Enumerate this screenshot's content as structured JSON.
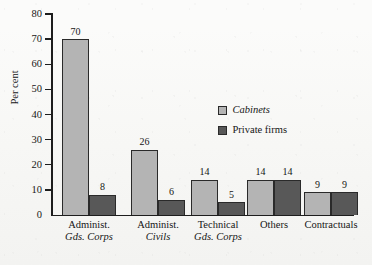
{
  "chart_data": {
    "type": "bar",
    "title": "",
    "xlabel": "",
    "ylabel": "Per cent",
    "ylim": [
      0,
      80
    ],
    "ytick_step": 10,
    "grid": false,
    "legend_position": "inside-right",
    "categories": [
      {
        "line1": "Administ.",
        "line2": "Gds. Corps"
      },
      {
        "line1": "Administ.",
        "line2": "Civils"
      },
      {
        "line1": "Technical",
        "line2": "Gds. Corps"
      },
      {
        "line1": "Others",
        "line2": ""
      },
      {
        "line1": "Contractuals",
        "line2": ""
      }
    ],
    "category_labels": [
      "Administ. Gds. Corps",
      "Administ. Civils",
      "Technical Gds. Corps",
      "Others",
      "Contractuals"
    ],
    "series": [
      {
        "name": "Cabinets",
        "color": "#b4b4b4",
        "italic": true,
        "values": [
          70,
          26,
          14,
          14,
          9
        ]
      },
      {
        "name": "Private firms",
        "color": "#585858",
        "italic": false,
        "values": [
          8,
          6,
          5,
          14,
          9
        ]
      }
    ],
    "yticks": [
      {
        "value": 80,
        "label": "80"
      },
      {
        "value": 70,
        "label": "70"
      },
      {
        "value": 60,
        "label": "60"
      },
      {
        "value": 50,
        "label": "50"
      },
      {
        "value": 40,
        "label": "40"
      },
      {
        "value": 30,
        "label": "30"
      },
      {
        "value": 20,
        "label": "20"
      },
      {
        "value": 10,
        "label": "10"
      },
      {
        "value": 0,
        "label": "0"
      }
    ]
  },
  "legend": {
    "items": [
      {
        "label": "Cabinets",
        "color": "#b4b4b4"
      },
      {
        "label": "Private firms",
        "color": "#585858"
      }
    ]
  },
  "caption": {
    "text": ""
  },
  "colors": {
    "series_light": "#b4b4b4",
    "series_dark": "#585858",
    "axis": "#1d1d1d",
    "text": "#151515",
    "background": "#fbfbfa"
  }
}
